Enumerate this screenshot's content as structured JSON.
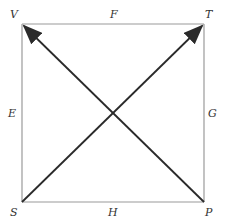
{
  "diagram": {
    "type": "square-with-diagonal-arrows",
    "colors": {
      "edge": "#9a9a9a",
      "arrow": "#2a2a2a",
      "label": "#333333",
      "background": "#ffffff"
    },
    "vertices": {
      "top_left": "V",
      "top_right": "T",
      "bottom_left": "S",
      "bottom_right": "P"
    },
    "edges": {
      "top": "F",
      "left": "E",
      "right": "G",
      "bottom": "H"
    },
    "arrows": [
      {
        "from": "S",
        "to": "T"
      },
      {
        "from": "P",
        "to": "V"
      }
    ]
  }
}
